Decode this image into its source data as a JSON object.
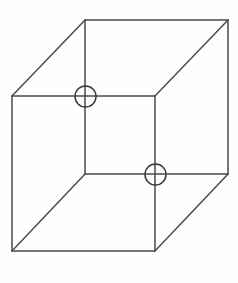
{
  "figure": {
    "name": "necker-cube",
    "canvas": {
      "width": 238,
      "height": 283,
      "background": "#fefefe"
    },
    "style": {
      "line_color": "#4a4a4a",
      "circle_color": "#3c3c3c",
      "line_width": 1.5,
      "circle_width": 1.5
    },
    "geometry": {
      "front_face": {
        "label": "front-square",
        "points": "12,96 155,96 155,251 12,251",
        "corners": [
          {
            "name": "front-top-left",
            "x": 12,
            "y": 96
          },
          {
            "name": "front-top-right",
            "x": 155,
            "y": 96
          },
          {
            "name": "front-bottom-right",
            "x": 155,
            "y": 251
          },
          {
            "name": "front-bottom-left",
            "x": 12,
            "y": 251
          }
        ]
      },
      "back_face": {
        "label": "back-square",
        "points": "85,20 228,20 228,174 85,174",
        "corners": [
          {
            "name": "back-top-left",
            "x": 85,
            "y": 20
          },
          {
            "name": "back-top-right",
            "x": 228,
            "y": 20
          },
          {
            "name": "back-bottom-right",
            "x": 228,
            "y": 174
          },
          {
            "name": "back-bottom-left",
            "x": 85,
            "y": 174
          }
        ]
      },
      "connectors": [
        {
          "name": "connector-top-left",
          "x1": 12,
          "y1": 96,
          "x2": 85,
          "y2": 20
        },
        {
          "name": "connector-top-right",
          "x1": 155,
          "y1": 96,
          "x2": 228,
          "y2": 20
        },
        {
          "name": "connector-bottom-right",
          "x1": 155,
          "y1": 251,
          "x2": 228,
          "y2": 174
        },
        {
          "name": "connector-bottom-left",
          "x1": 12,
          "y1": 251,
          "x2": 85,
          "y2": 174
        }
      ]
    },
    "markers": [
      {
        "name": "upper-junction-marker",
        "cx": 85.5,
        "cy": 96.5,
        "r": 10.5
      },
      {
        "name": "lower-junction-marker",
        "cx": 155.5,
        "cy": 174.5,
        "r": 10.5
      }
    ]
  }
}
